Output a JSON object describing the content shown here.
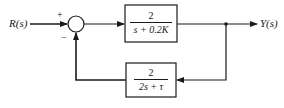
{
  "diagram": {
    "type": "feedback-control-block-diagram",
    "input": {
      "label": "R(s)"
    },
    "output": {
      "label": "Y(s)"
    },
    "summing_junction": {
      "plus_sign": "+",
      "minus_sign": "−"
    },
    "forward_block": {
      "numerator": "2",
      "denominator": "s + 0.2K"
    },
    "feedback_block": {
      "numerator": "2",
      "denominator": "2s + τ"
    },
    "colors": {
      "line": "#1a1a1a",
      "background": "#ffffff"
    }
  }
}
